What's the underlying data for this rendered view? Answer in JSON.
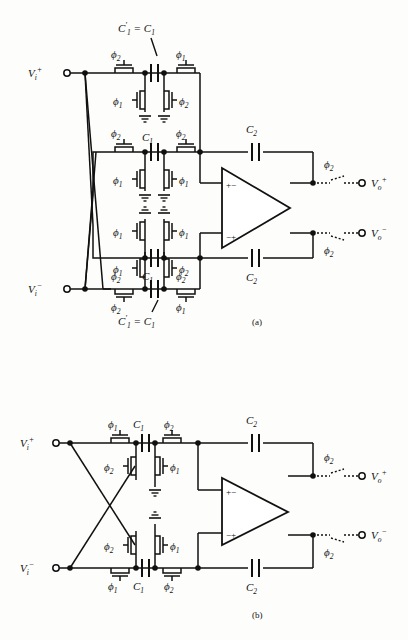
{
  "figure": {
    "ink_color": "#111111",
    "background": "#fdfdfb"
  },
  "symbols": {
    "phi1": "ϕ",
    "phi2": "ϕ",
    "one": "1",
    "two": "2",
    "C": "C",
    "V": "V",
    "i": "i",
    "o": "o",
    "plus": "+",
    "minus": "−",
    "equals": "="
  },
  "circuit_a": {
    "caption": "(a)",
    "inputs": [
      {
        "name": "vi-plus",
        "label": "V",
        "sub": "i",
        "sup": "+"
      },
      {
        "name": "vi-minus",
        "label": "V",
        "sub": "i",
        "sup": "−"
      }
    ],
    "outputs": [
      {
        "name": "vo-plus",
        "label": "V",
        "sub": "o",
        "sup": "+",
        "switch_phase": "ϕ",
        "switch_phase_sub": "2"
      },
      {
        "name": "vo-minus",
        "label": "V",
        "sub": "o",
        "sup": "−",
        "switch_phase": "ϕ",
        "switch_phase_sub": "2"
      }
    ],
    "annotations": [
      {
        "name": "c1-prime-top",
        "text": "C′₁ = C₁",
        "parts": [
          "C",
          "1",
          "=",
          "C",
          "1"
        ]
      },
      {
        "name": "c1-prime-bottom",
        "text": "C′₁ = C₁",
        "parts": [
          "C",
          "1",
          "=",
          "C",
          "1"
        ]
      }
    ],
    "sections": [
      {
        "name": "section-1-top",
        "cap": {
          "label": "C",
          "sub": "1",
          "primed": true
        },
        "switch_top_left": {
          "phase": "ϕ",
          "sub": "2"
        },
        "switch_top_right": {
          "phase": "ϕ",
          "sub": "1"
        },
        "switch_bot_left": {
          "phase": "ϕ",
          "sub": "1"
        },
        "switch_bot_right": {
          "phase": "ϕ",
          "sub": "2"
        }
      },
      {
        "name": "section-2",
        "cap": {
          "label": "C",
          "sub": "1",
          "primed": false
        },
        "switch_top_left": {
          "phase": "ϕ",
          "sub": "2"
        },
        "switch_top_right": {
          "phase": "ϕ",
          "sub": "2"
        },
        "switch_bot_left": {
          "phase": "ϕ",
          "sub": "1"
        },
        "switch_bot_right": {
          "phase": "ϕ",
          "sub": "1"
        }
      },
      {
        "name": "section-3",
        "cap": {
          "label": "C",
          "sub": "1",
          "primed": false
        },
        "switch_top_left": {
          "phase": "ϕ",
          "sub": "1"
        },
        "switch_top_right": {
          "phase": "ϕ",
          "sub": "1"
        },
        "switch_bot_left": {
          "phase": "ϕ",
          "sub": "2"
        },
        "switch_bot_right": {
          "phase": "ϕ",
          "sub": "2"
        }
      },
      {
        "name": "section-4-bottom",
        "cap": {
          "label": "C",
          "sub": "1",
          "primed": true
        },
        "switch_top_left": {
          "phase": "ϕ",
          "sub": "1"
        },
        "switch_top_right": {
          "phase": "ϕ",
          "sub": "2"
        },
        "switch_bot_left": {
          "phase": "ϕ",
          "sub": "2"
        },
        "switch_bot_right": {
          "phase": "ϕ",
          "sub": "1"
        }
      }
    ],
    "feedback_caps": [
      {
        "name": "c2-top",
        "label": "C",
        "sub": "2"
      },
      {
        "name": "c2-bottom",
        "label": "C",
        "sub": "2"
      }
    ],
    "opamp": {
      "name": "opamp-a",
      "in_top": "+−",
      "in_bottom": "−+"
    }
  },
  "circuit_b": {
    "caption": "(b)",
    "inputs": [
      {
        "name": "vi-plus",
        "label": "V",
        "sub": "i",
        "sup": "+"
      },
      {
        "name": "vi-minus",
        "label": "V",
        "sub": "i",
        "sup": "−"
      }
    ],
    "outputs": [
      {
        "name": "vo-plus",
        "label": "V",
        "sub": "o",
        "sup": "+",
        "switch_phase": "ϕ",
        "switch_phase_sub": "2"
      },
      {
        "name": "vo-minus",
        "label": "V",
        "sub": "o",
        "sup": "−",
        "switch_phase": "ϕ",
        "switch_phase_sub": "2"
      }
    ],
    "sections": [
      {
        "name": "section-top",
        "cap": {
          "label": "C",
          "sub": "1"
        },
        "switch_top_left": {
          "phase": "ϕ",
          "sub": "1"
        },
        "switch_top_right": {
          "phase": "ϕ",
          "sub": "2"
        },
        "switch_bot_left": {
          "phase": "ϕ",
          "sub": "2"
        },
        "switch_bot_right": {
          "phase": "ϕ",
          "sub": "1"
        }
      },
      {
        "name": "section-bottom",
        "cap": {
          "label": "C",
          "sub": "1"
        },
        "switch_top_left": {
          "phase": "ϕ",
          "sub": "2"
        },
        "switch_top_right": {
          "phase": "ϕ",
          "sub": "1"
        },
        "switch_bot_left": {
          "phase": "ϕ",
          "sub": "1"
        },
        "switch_bot_right": {
          "phase": "ϕ",
          "sub": "2"
        }
      }
    ],
    "feedback_caps": [
      {
        "name": "c2-top",
        "label": "C",
        "sub": "2"
      },
      {
        "name": "c2-bottom",
        "label": "C",
        "sub": "2"
      }
    ],
    "opamp": {
      "name": "opamp-b",
      "in_top": "+−",
      "in_bottom": "−+"
    }
  }
}
